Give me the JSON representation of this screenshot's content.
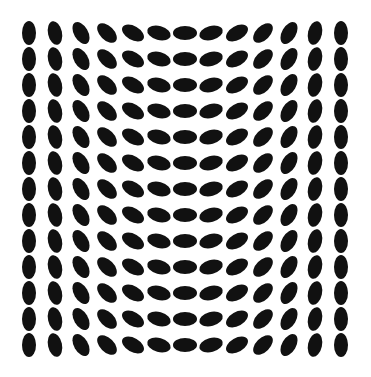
{
  "figure": {
    "background": "#ffffff",
    "dot_color": "#111111",
    "rows": 13,
    "cols": 13,
    "origin_x": 28.5,
    "origin_y": 33,
    "spacing_x": 26,
    "spacing_y": 26,
    "dot_width": 14,
    "dot_height": 24,
    "column_angles_deg": [
      0,
      -12,
      -30,
      -45,
      -60,
      -75,
      90,
      75,
      60,
      45,
      30,
      12,
      0
    ]
  }
}
